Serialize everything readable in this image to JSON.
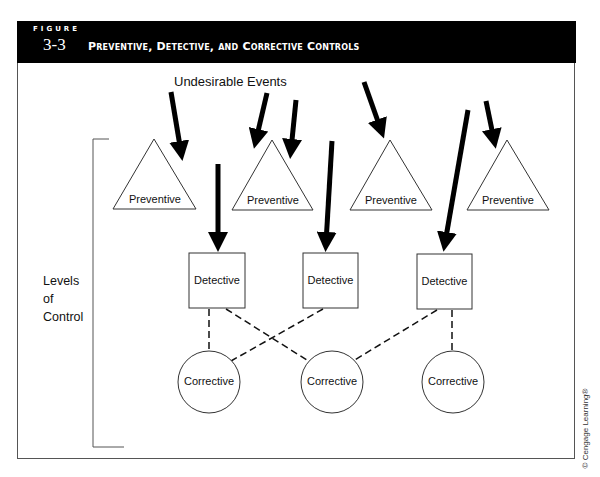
{
  "figure": {
    "label_word": "FIGURE",
    "number": "3-3",
    "title": "Preventive, Detective, and Corrective Controls"
  },
  "diagram": {
    "top_label": "Undesirable Events",
    "side_label_lines": [
      "Levels",
      "of",
      "Control"
    ],
    "preventive": [
      {
        "label": "Preventive"
      },
      {
        "label": "Preventive"
      },
      {
        "label": "Preventive"
      },
      {
        "label": "Preventive"
      }
    ],
    "detective": [
      {
        "label": "Detective"
      },
      {
        "label": "Detective"
      },
      {
        "label": "Detective"
      }
    ],
    "corrective": [
      {
        "label": "Corrective"
      },
      {
        "label": "Corrective"
      },
      {
        "label": "Corrective"
      }
    ],
    "arrow_count": 8,
    "connections": [
      {
        "from": "Detective 1",
        "to": "Corrective 1"
      },
      {
        "from": "Detective 1",
        "to": "Corrective 2"
      },
      {
        "from": "Detective 2",
        "to": "Corrective 1"
      },
      {
        "from": "Detective 3",
        "to": "Corrective 2"
      },
      {
        "from": "Detective 3",
        "to": "Corrective 3"
      }
    ]
  },
  "credit": "© Cengage Learning®"
}
